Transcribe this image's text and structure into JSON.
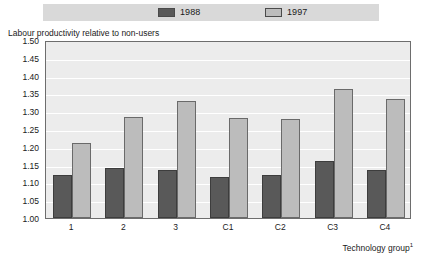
{
  "chart_data": {
    "type": "bar",
    "title": "",
    "subtitle": "",
    "categories": [
      "1",
      "2",
      "3",
      "C1",
      "C2",
      "C3",
      "C4"
    ],
    "series": [
      {
        "name": "1988",
        "color": "#595959",
        "values": [
          1.12,
          1.14,
          1.135,
          1.115,
          1.12,
          1.16,
          1.135
        ]
      },
      {
        "name": "1997",
        "color": "#bcbcbc",
        "values": [
          1.21,
          1.285,
          1.33,
          1.28,
          1.277,
          1.363,
          1.335
        ]
      }
    ],
    "xlabel": "Technology group",
    "xlabel_footnote": "1",
    "ylabel": "Labour productivity relative to non-users",
    "ylim": [
      1.0,
      1.5
    ],
    "ytick_step": 0.05,
    "ytick_labels": [
      "1.50",
      "1.45",
      "1.40",
      "1.35",
      "1.30",
      "1.25",
      "1.20",
      "1.15",
      "1.10",
      "1.05",
      "1.00"
    ],
    "ytick_values": [
      1.5,
      1.45,
      1.4,
      1.35,
      1.3,
      1.25,
      1.2,
      1.15,
      1.1,
      1.05,
      1.0
    ],
    "grid": true,
    "grid_color": "#ffffff",
    "plot_background": "#ececec",
    "legend_position": "top",
    "legend_entries": [
      "1988",
      "1997"
    ]
  },
  "legend": {
    "background": "#d9d9d9",
    "items": [
      {
        "label": "1988",
        "swatch": "legend-swatch-1988"
      },
      {
        "label": "1997",
        "swatch": "legend-swatch-1997"
      }
    ]
  },
  "axes": {
    "y_title": "Labour productivity relative to non-users",
    "x_caption": "Technology group",
    "x_caption_footnote": "1"
  }
}
